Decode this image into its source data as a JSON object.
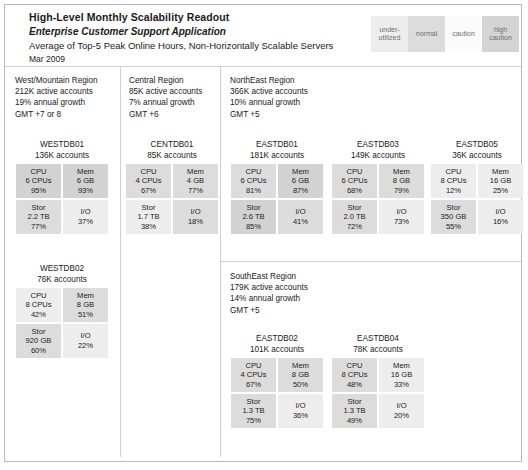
{
  "header": {
    "title": "High-Level Monthly Scalability Readout",
    "subtitle": "Enterprise Customer Support Application",
    "description": "Average of Top-5 Peak Online Hours, Non-Horizontally Scalable Servers",
    "date": "Mar 2009"
  },
  "legend": {
    "items": [
      {
        "label": "under-utilized",
        "color": "#ededed",
        "key": "under"
      },
      {
        "label": "normal",
        "color": "#dcdcdc",
        "key": "normal"
      },
      {
        "label": "caution",
        "color": "#fbfbfb",
        "key": "caution"
      },
      {
        "label": "high caution",
        "color": "#d4d4d4",
        "key": "high"
      }
    ]
  },
  "regions": [
    {
      "name": "West/Mountain Region",
      "accounts": "212K active accounts",
      "growth": "19% annual growth",
      "gmt": "GMT +7 or 8"
    },
    {
      "name": "Central Region",
      "accounts": "85K active accounts",
      "growth": "7% annual growth",
      "gmt": "GMT +6"
    },
    {
      "name": "NorthEast Region",
      "accounts": "366K active accounts",
      "growth": "10% annual growth",
      "gmt": "GMT +5"
    },
    {
      "name": "SouthEast Region",
      "accounts": "179K active accounts",
      "growth": "14% annual growth",
      "gmt": "GMT +5"
    }
  ],
  "servers": [
    {
      "id": "westdb01",
      "name": "WESTDB01",
      "accounts": "136K accounts",
      "cpu": {
        "label": "CPU",
        "value": "6 CPUs",
        "pct": "95%",
        "status": "high"
      },
      "mem": {
        "label": "Mem",
        "value": "6 GB",
        "pct": "93%",
        "status": "high"
      },
      "stor": {
        "label": "Stor",
        "value": "2.2 TB",
        "pct": "77%",
        "status": "normal"
      },
      "io": {
        "label": "I/O",
        "value": "",
        "pct": "37%",
        "status": "under"
      }
    },
    {
      "id": "westdb02",
      "name": "WESTDB02",
      "accounts": "76K accounts",
      "cpu": {
        "label": "CPU",
        "value": "8 CPUs",
        "pct": "42%",
        "status": "under"
      },
      "mem": {
        "label": "Mem",
        "value": "8 GB",
        "pct": "51%",
        "status": "normal"
      },
      "stor": {
        "label": "Stor",
        "value": "920 GB",
        "pct": "60%",
        "status": "normal"
      },
      "io": {
        "label": "I/O",
        "value": "",
        "pct": "22%",
        "status": "under"
      }
    },
    {
      "id": "centdb01",
      "name": "CENTDB01",
      "accounts": "85K accounts",
      "cpu": {
        "label": "CPU",
        "value": "4 CPUs",
        "pct": "67%",
        "status": "normal"
      },
      "mem": {
        "label": "Mem",
        "value": "4 GB",
        "pct": "77%",
        "status": "normal"
      },
      "stor": {
        "label": "Stor",
        "value": "1.7 TB",
        "pct": "38%",
        "status": "under"
      },
      "io": {
        "label": "I/O",
        "value": "",
        "pct": "18%",
        "status": "normal"
      }
    },
    {
      "id": "eastdb01",
      "name": "EASTDB01",
      "accounts": "181K accounts",
      "cpu": {
        "label": "CPU",
        "value": "6 CPUs",
        "pct": "81%",
        "status": "normal"
      },
      "mem": {
        "label": "Mem",
        "value": "6 GB",
        "pct": "87%",
        "status": "high"
      },
      "stor": {
        "label": "Stor",
        "value": "2.6 TB",
        "pct": "85%",
        "status": "high"
      },
      "io": {
        "label": "I/O",
        "value": "",
        "pct": "41%",
        "status": "normal"
      }
    },
    {
      "id": "eastdb03",
      "name": "EASTDB03",
      "accounts": "149K accounts",
      "cpu": {
        "label": "CPU",
        "value": "6 CPUs",
        "pct": "68%",
        "status": "normal"
      },
      "mem": {
        "label": "Mem",
        "value": "8 GB",
        "pct": "79%",
        "status": "normal"
      },
      "stor": {
        "label": "Stor",
        "value": "2.0 TB",
        "pct": "72%",
        "status": "normal"
      },
      "io": {
        "label": "I/O",
        "value": "",
        "pct": "73%",
        "status": "under"
      }
    },
    {
      "id": "eastdb05",
      "name": "EASTDB05",
      "accounts": "36K accounts",
      "cpu": {
        "label": "CPU",
        "value": "8 CPUs",
        "pct": "12%",
        "status": "under"
      },
      "mem": {
        "label": "Mem",
        "value": "16 GB",
        "pct": "25%",
        "status": "under"
      },
      "stor": {
        "label": "Stor",
        "value": "350 GB",
        "pct": "55%",
        "status": "normal"
      },
      "io": {
        "label": "I/O",
        "value": "",
        "pct": "16%",
        "status": "under"
      }
    },
    {
      "id": "eastdb02",
      "name": "EASTDB02",
      "accounts": "101K accounts",
      "cpu": {
        "label": "CPU",
        "value": "4 CPUs",
        "pct": "67%",
        "status": "normal"
      },
      "mem": {
        "label": "Mem",
        "value": "8 GB",
        "pct": "50%",
        "status": "normal"
      },
      "stor": {
        "label": "Stor",
        "value": "1.3 TB",
        "pct": "75%",
        "status": "normal"
      },
      "io": {
        "label": "I/O",
        "value": "",
        "pct": "36%",
        "status": "under"
      }
    },
    {
      "id": "eastdb04",
      "name": "EASTDB04",
      "accounts": "78K accounts",
      "cpu": {
        "label": "CPU",
        "value": "8 CPUs",
        "pct": "48%",
        "status": "normal"
      },
      "mem": {
        "label": "Mem",
        "value": "16 GB",
        "pct": "33%",
        "status": "under"
      },
      "stor": {
        "label": "Stor",
        "value": "1.3 TB",
        "pct": "49%",
        "status": "normal"
      },
      "io": {
        "label": "I/O",
        "value": "",
        "pct": "20%",
        "status": "under"
      }
    }
  ]
}
